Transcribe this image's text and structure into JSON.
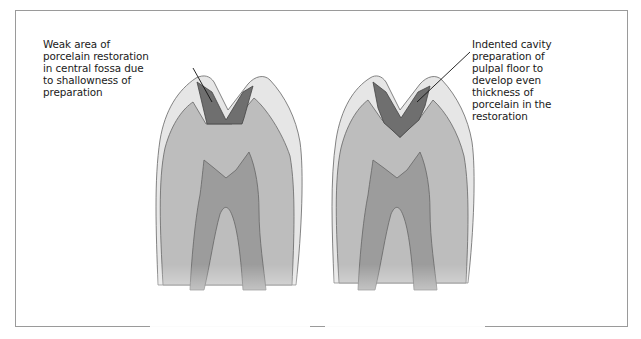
{
  "figure": {
    "type": "tooth cross-section comparison",
    "panels": [
      {
        "id": "left",
        "label": "Weak area of\nporcelain restoration\nin central fossa due\nto shallowness of\npreparation",
        "restoration": "shallow flat-floored preparation"
      },
      {
        "id": "right",
        "label": "Indented cavity\npreparation of\npulpal floor to\ndevelop even\nthickness of\nporcelain in the\nrestoration",
        "restoration": "indented V-shaped pulpal floor preparation"
      }
    ],
    "colors": {
      "enamel": "#e6e6e6",
      "dentin": "#bdbdbd",
      "pulp": "#9c9c9c",
      "restoration": "#6f6f6f",
      "outline": "#555555",
      "frame": "#9a9a9a"
    }
  }
}
